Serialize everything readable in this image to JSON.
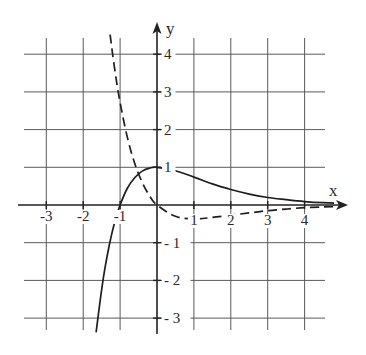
{
  "chart_data": {
    "type": "line",
    "title": "",
    "xlabel": "x",
    "ylabel": "y",
    "xlim": [
      -3.6,
      5.0
    ],
    "ylim": [
      -3.3,
      4.9
    ],
    "grid": true,
    "x_ticks": [
      -3,
      -2,
      -1,
      1,
      2,
      3,
      4
    ],
    "x_tick_labels": [
      "-3",
      "-2",
      "-1",
      "1",
      "2",
      "3",
      "4"
    ],
    "y_ticks": [
      4,
      3,
      2,
      1,
      -1,
      -2,
      -3
    ],
    "y_tick_labels": [
      "4",
      "3",
      "2",
      "1",
      "- 1",
      "- 2",
      "- 3"
    ],
    "series": [
      {
        "name": "f(x) = (x+1)e^(-x)",
        "style": "solid",
        "x": [
          -1.65,
          -1.5,
          -1.4,
          -1.3,
          -1.2,
          -1.1,
          -1.0,
          -0.8,
          -0.6,
          -0.4,
          -0.2,
          0.0,
          0.5,
          1.0,
          1.5,
          2.0,
          2.5,
          3.0,
          3.5,
          4.0,
          4.5,
          4.8
        ],
        "y": [
          -3.38,
          -2.24,
          -1.62,
          -1.1,
          -0.66,
          -0.3,
          0.0,
          0.45,
          0.73,
          0.9,
          0.98,
          1.0,
          0.91,
          0.74,
          0.56,
          0.41,
          0.29,
          0.2,
          0.14,
          0.09,
          0.06,
          0.05
        ]
      },
      {
        "name": "f'(x) = -x e^(-x)",
        "style": "dashed",
        "x": [
          -1.27,
          -1.2,
          -1.1,
          -1.0,
          -0.8,
          -0.6,
          -0.4,
          -0.2,
          0.0,
          0.5,
          1.0,
          1.5,
          2.0,
          2.5,
          3.0,
          3.5,
          4.0,
          4.5,
          4.8
        ],
        "y": [
          4.52,
          3.98,
          3.3,
          2.72,
          1.78,
          1.09,
          0.6,
          0.24,
          0.0,
          -0.3,
          -0.37,
          -0.33,
          -0.27,
          -0.21,
          -0.15,
          -0.11,
          -0.07,
          -0.05,
          -0.04
        ]
      }
    ]
  }
}
